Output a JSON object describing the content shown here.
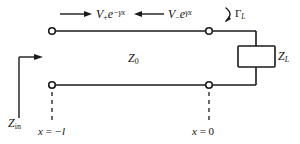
{
  "figure": {
    "background_color": "#ffffff",
    "line_color": "#1a1a1a",
    "width": 300,
    "height": 144
  },
  "labels": {
    "forward_wave": {
      "base": "V",
      "sub": "+",
      "exp_base": "e",
      "exp": "−γx",
      "full": "V₊e⁻γˣ"
    },
    "reverse_wave": {
      "base": "V",
      "sub": "−",
      "exp_base": "e",
      "exp": "γx",
      "full": "V₋eγˣ"
    },
    "reflection_coefficient": {
      "base": "Γ",
      "sub": "L",
      "full": "ΓL"
    },
    "characteristic_impedance": {
      "base": "Z",
      "sub": "0",
      "full": "Z0"
    },
    "load_impedance": {
      "base": "Z",
      "sub": "L",
      "full": "ZL"
    },
    "input_impedance": {
      "base": "Z",
      "sub": "in",
      "full": "Zin"
    },
    "position_left": {
      "var": "x",
      "eq": "=",
      "value": "−l",
      "full": "x = −l"
    },
    "position_right": {
      "var": "x",
      "eq": "=",
      "value": "0",
      "full": "x = 0"
    }
  },
  "icons": {
    "forward_arrow": "arrow-right-icon",
    "reverse_arrow": "arrow-left-icon",
    "reflection_arc": "curved-arc-icon",
    "input_arrow": "arrow-right-icon"
  },
  "geometry": {
    "top_conductor_y": 31,
    "bottom_conductor_y": 85,
    "left_terminal_x": 52,
    "right_terminal_x": 209,
    "load_branch_x": 256,
    "resistor_box": {
      "x": 238,
      "y": 46,
      "w": 37,
      "h": 21
    }
  }
}
